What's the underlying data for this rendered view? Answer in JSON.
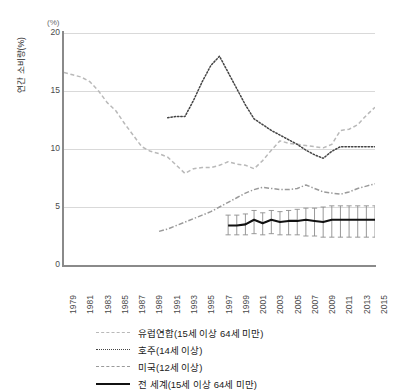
{
  "top_ghost_text": "",
  "axis": {
    "unit": "(%)",
    "y_title": "연간 소비량(%)",
    "y_ticks": [
      "20",
      "15",
      "10",
      "5",
      "0"
    ],
    "x_ticks": [
      "1979",
      "1981",
      "1983",
      "1985",
      "1987",
      "1989",
      "1991",
      "1993",
      "1995",
      "1997",
      "1999",
      "2001",
      "2003",
      "2005",
      "2007",
      "2009",
      "2011",
      "2013",
      "2015"
    ]
  },
  "legend": {
    "items": [
      {
        "name": "eu",
        "label": "유럽연합(15세 이상 64세 미만)",
        "color": "#b9b9b9",
        "style": "dashed"
      },
      {
        "name": "au",
        "label": "호주(14세 이상)",
        "color": "#444444",
        "style": "dotted"
      },
      {
        "name": "us",
        "label": "미국(12세 이상)",
        "color": "#9a9a9a",
        "style": "dash-dot"
      },
      {
        "name": "world",
        "label": "전 세계(15세 이상 64세 미만)",
        "color": "#111111",
        "style": "solid"
      }
    ]
  },
  "chart_data": {
    "type": "line",
    "title": "",
    "xlabel": "",
    "ylabel": "연간 소비량(%)",
    "ylim": [
      0,
      20
    ],
    "xlim": [
      1979,
      2015
    ],
    "yticks": [
      0,
      5,
      10,
      15,
      20
    ],
    "xticks": [
      1979,
      1981,
      1983,
      1985,
      1987,
      1989,
      1991,
      1993,
      1995,
      1997,
      1999,
      2001,
      2003,
      2005,
      2007,
      2009,
      2011,
      2013,
      2015
    ],
    "grid": "horizontal",
    "legend_position": "bottom",
    "series": [
      {
        "name": "유럽연합(15세 이상 64세 미만)",
        "color": "#b9b9b9",
        "style": "dashed",
        "x": [
          1979,
          1980,
          1981,
          1982,
          1983,
          1984,
          1985,
          1986,
          1987,
          1988,
          1989,
          1990,
          1991,
          1992,
          1993,
          1994,
          1995,
          1996,
          1997,
          1998,
          1999,
          2000,
          2001,
          2002,
          2003,
          2004,
          2005,
          2006,
          2007,
          2008,
          2009,
          2010,
          2011,
          2012,
          2013,
          2014,
          2015
        ],
        "values": [
          16.6,
          16.4,
          16.2,
          15.8,
          15.0,
          14.0,
          13.3,
          12.2,
          11.2,
          10.2,
          9.8,
          9.6,
          9.3,
          8.6,
          7.9,
          8.3,
          8.4,
          8.4,
          8.6,
          8.9,
          8.7,
          8.6,
          8.3,
          9.0,
          9.9,
          10.7,
          10.5,
          10.4,
          10.3,
          10.2,
          10.1,
          10.4,
          11.6,
          11.7,
          12.1,
          12.9,
          13.6
        ]
      },
      {
        "name": "호주(14세 이상)",
        "color": "#444444",
        "style": "dotted",
        "x": [
          1991,
          1992,
          1993,
          1994,
          1995,
          1996,
          1997,
          1998,
          1999,
          2000,
          2001,
          2002,
          2003,
          2004,
          2005,
          2006,
          2007,
          2008,
          2009,
          2010,
          2011,
          2012,
          2013,
          2014,
          2015
        ],
        "values": [
          12.7,
          12.8,
          12.8,
          14.2,
          15.8,
          17.2,
          18.0,
          16.6,
          15.2,
          13.8,
          12.6,
          12.1,
          11.6,
          11.2,
          10.8,
          10.4,
          9.9,
          9.5,
          9.2,
          9.8,
          10.2,
          10.2,
          10.2,
          10.2,
          10.2
        ]
      },
      {
        "name": "미국(12세 이상)",
        "color": "#9a9a9a",
        "style": "dash-dot",
        "x": [
          1990,
          1991,
          1992,
          1993,
          1994,
          1995,
          1996,
          1997,
          1998,
          1999,
          2000,
          2001,
          2002,
          2003,
          2004,
          2005,
          2006,
          2007,
          2008,
          2009,
          2010,
          2011,
          2012,
          2013,
          2014,
          2015
        ],
        "values": [
          2.9,
          3.1,
          3.4,
          3.7,
          4.0,
          4.3,
          4.6,
          5.0,
          5.4,
          5.8,
          6.2,
          6.5,
          6.7,
          6.6,
          6.5,
          6.5,
          6.6,
          6.9,
          6.6,
          6.3,
          6.2,
          6.1,
          6.3,
          6.6,
          6.8,
          7.0
        ]
      },
      {
        "name": "전 세계(15세 이상 64세 미만)",
        "color": "#111111",
        "style": "solid",
        "x": [
          1998,
          1999,
          2000,
          2001,
          2002,
          2003,
          2004,
          2005,
          2006,
          2007,
          2008,
          2009,
          2010,
          2011,
          2012,
          2013,
          2014,
          2015
        ],
        "values": [
          3.4,
          3.4,
          3.5,
          3.9,
          3.6,
          3.9,
          3.7,
          3.8,
          3.8,
          3.9,
          3.8,
          3.7,
          3.9,
          3.9,
          3.9,
          3.9,
          3.9,
          3.9
        ],
        "error_low": [
          2.6,
          2.6,
          2.6,
          2.7,
          2.6,
          2.7,
          2.6,
          2.6,
          2.6,
          2.5,
          2.5,
          2.4,
          2.4,
          2.4,
          2.4,
          2.4,
          2.4,
          2.4
        ],
        "error_high": [
          4.3,
          4.3,
          4.4,
          4.7,
          4.5,
          4.7,
          4.6,
          4.7,
          4.8,
          4.9,
          4.9,
          5.0,
          5.1,
          5.1,
          5.1,
          5.1,
          5.1,
          5.1
        ]
      }
    ]
  }
}
